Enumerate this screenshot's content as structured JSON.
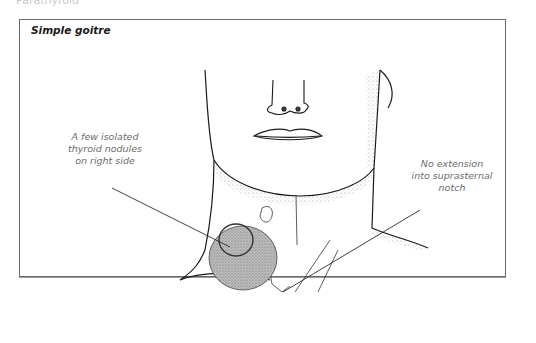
{
  "page_header": "Parathyroid",
  "figure": {
    "title": "Simple goitre",
    "labels": {
      "left_line1": "A few isolated",
      "left_line2": "thyroid nodules",
      "left_line3": "on right side",
      "right_line1": "No extension",
      "right_line2": "into suprasternal",
      "right_line3": "notch"
    },
    "colors": {
      "frame": "#6a6a6a",
      "line_art": "#1a1a1a",
      "label_text": "#6c6c6c",
      "goitre_fill": "#b8b8b8"
    }
  }
}
